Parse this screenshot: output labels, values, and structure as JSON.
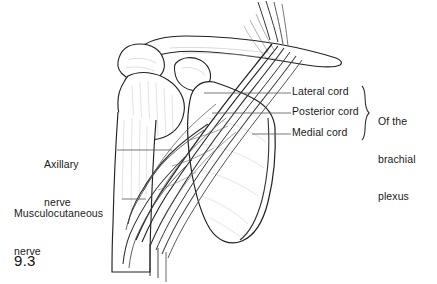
{
  "figure": {
    "number": "9.3"
  },
  "labels": {
    "lateral_cord": "Lateral cord",
    "posterior_cord": "Posterior cord",
    "medial_cord": "Medial cord",
    "plexus_group_line1": "Of the",
    "plexus_group_line2": "brachial",
    "plexus_group_line3": "plexus",
    "axillary_line1": "Axillary",
    "axillary_line2": "nerve",
    "musculocutaneous_line1": "Musculocutaneous",
    "musculocutaneous_line2": "nerve"
  },
  "colors": {
    "ink": "#1a1a1a",
    "outline": "#222222",
    "hatch": "#9a9a9a",
    "faint": "#c9c9c9",
    "background": "#ffffff",
    "leader": "#555555"
  },
  "structures": {
    "clavicle": "clavicle",
    "acromion": "acromion",
    "coracoid_process": "coracoid process",
    "humerus": "humerus",
    "scapula": "scapula",
    "nerve_cords": "brachial plexus cords"
  }
}
